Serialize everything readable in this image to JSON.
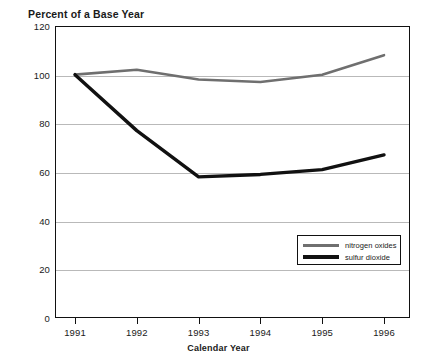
{
  "figure": {
    "truncated_top_title_fragment": ".",
    "y_axis_title": "Percent of a Base Year",
    "x_axis_title": "Calendar Year"
  },
  "legend": {
    "position": "inside-lower-right",
    "entries": [
      {
        "label": "nitrogen oxides",
        "color": "#6f6f6f",
        "style": "thin-gray-line"
      },
      {
        "label": "sulfur dioxide",
        "color": "#111111",
        "style": "thick-black-line"
      }
    ]
  },
  "chart_data": {
    "type": "line",
    "title": "",
    "subtitle": "",
    "xlabel": "Calendar Year",
    "ylabel": "Percent of a Base Year",
    "x": [
      "1991",
      "1992",
      "1993",
      "1994",
      "1995",
      "1996"
    ],
    "categories": [
      "1991",
      "1992",
      "1993",
      "1994",
      "1995",
      "1996"
    ],
    "series": [
      {
        "name": "nitrogen oxides",
        "color": "#6f6f6f",
        "line_width": 2.6,
        "values": [
          100,
          102,
          98,
          97,
          100,
          108
        ]
      },
      {
        "name": "sulfur dioxide",
        "color": "#111111",
        "line_width": 3.4,
        "values": [
          100,
          77,
          58,
          59,
          61,
          67
        ]
      }
    ],
    "xlim": [
      "1991",
      "1996"
    ],
    "ylim": [
      0,
      120
    ],
    "yticks": [
      0,
      20,
      40,
      60,
      80,
      100,
      120
    ],
    "ytick_labels": [
      "0",
      "20",
      "40",
      "60",
      "80",
      "100",
      "120"
    ],
    "xticks": [
      "1991",
      "1992",
      "1993",
      "1994",
      "1995",
      "1996"
    ],
    "grid": "horizontal-only",
    "gridlines_at": [
      20,
      40,
      60,
      80,
      100
    ],
    "legend_position": "lower right (inside axes)"
  }
}
